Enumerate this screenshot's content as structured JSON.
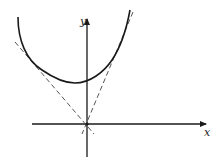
{
  "diagram": {
    "axes": {
      "x_label": "x",
      "y_label": "y",
      "origin": [
        87,
        124
      ]
    },
    "curve": {
      "type": "convex curve (U-shaped)",
      "min_point": [
        75,
        83
      ],
      "y_intercept": [
        87,
        80
      ]
    },
    "tangent_lines": [
      {
        "name": "left tangent",
        "style": "dashed",
        "through": "origin",
        "touch_point": [
          38,
          70
        ]
      },
      {
        "name": "right tangent",
        "style": "dashed",
        "through": "origin",
        "touch_point": [
          118,
          45
        ]
      }
    ],
    "colors": {
      "stroke": "#1a1a1a",
      "dashed": "#555555",
      "background": "#ffffff"
    }
  }
}
